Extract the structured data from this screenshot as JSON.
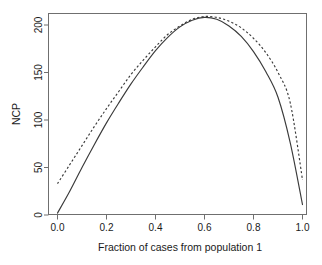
{
  "chart_data": {
    "type": "line",
    "title": "",
    "subtitle": "",
    "xlabel": "Fraction of cases from population 1",
    "ylabel": "NCP",
    "xlim": [
      0.0,
      1.0
    ],
    "ylim": [
      0,
      215
    ],
    "grid": false,
    "legend": "none",
    "x_ticks": [
      "0.0",
      "0.2",
      "0.4",
      "0.6",
      "0.8",
      "1.0"
    ],
    "x_tick_values": [
      0.0,
      0.2,
      0.4,
      0.6,
      0.8,
      1.0
    ],
    "y_ticks": [
      "0",
      "50",
      "100",
      "150",
      "200"
    ],
    "y_tick_values": [
      0,
      50,
      100,
      150,
      200
    ],
    "x": [
      0.0,
      0.05,
      0.1,
      0.15,
      0.2,
      0.25,
      0.3,
      0.35,
      0.4,
      0.45,
      0.5,
      0.55,
      0.6,
      0.65,
      0.7,
      0.75,
      0.8,
      0.85,
      0.9,
      0.95,
      1.0
    ],
    "series": [
      {
        "name": "solid-curve",
        "style": "solid",
        "color": "#3a3a3a",
        "values": [
          2,
          25,
          50,
          74,
          97,
          118,
          138,
          156,
          173,
          187,
          198,
          205,
          208,
          206,
          199,
          188,
          172,
          151,
          124,
          76,
          11
        ]
      },
      {
        "name": "dashed-curve",
        "style": "dashed",
        "color": "#3a3a3a",
        "values": [
          33,
          53,
          73,
          93,
          112,
          130,
          148,
          163,
          177,
          190,
          199,
          206,
          209,
          208,
          204,
          197,
          186,
          171,
          150,
          118,
          37
        ]
      }
    ],
    "annotations": []
  },
  "figure": {
    "width": 322,
    "height": 265,
    "background": "#ffffff",
    "frame_color": "#6f6f6f",
    "text_color": "#1a1a1a"
  }
}
